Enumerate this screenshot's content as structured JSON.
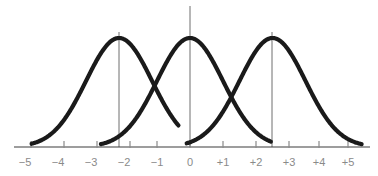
{
  "figure": {
    "name": "three-overlapping-normal-distribution-curves",
    "background_color": "#ffffff",
    "curve_color": "#1a1a1a",
    "curve_stroke_width": 4,
    "axis_color": "#3c3c3c",
    "axis_stroke_width": 1,
    "tick_color": "#8a8a8a",
    "tick_label_color": "#8a8a8a",
    "mean_line_color": "#6e6e6e",
    "mean_line_width": 1
  },
  "chart_data": {
    "type": "line",
    "title": "",
    "subtitle": "",
    "xlabel": "",
    "ylabel": "",
    "xlim": [
      -5.2,
      5.2
    ],
    "ylim": [
      0,
      1.05
    ],
    "grid": false,
    "legend": null,
    "axis": {
      "tick_values": [
        -5,
        -4,
        -3,
        -2,
        -1,
        0,
        1,
        2,
        3,
        4,
        5
      ],
      "tick_labels": [
        "−5",
        "−4",
        "−3",
        "−2",
        "−1",
        "0",
        "+1",
        "+2",
        "+3",
        "+4",
        "+5"
      ],
      "tick_length": 6,
      "axis_y_position": 147,
      "x_zero_pixel": 190,
      "pixels_per_unit": 33
    },
    "series": [
      {
        "name": "curve-left",
        "distribution": "normal",
        "mean": -2.15,
        "sigma": 1.0,
        "peak_value": 1.0,
        "peak_pixel": {
          "x": 119,
          "y": 38
        },
        "x_start": -4.8,
        "x_end": -0.35,
        "mean_line": true
      },
      {
        "name": "curve-center",
        "distribution": "normal",
        "mean": 0.0,
        "sigma": 1.0,
        "peak_value": 1.0,
        "peak_pixel": {
          "x": 190,
          "y": 38
        },
        "x_start": -2.7,
        "x_end": 2.45,
        "mean_line": true
      },
      {
        "name": "curve-right",
        "distribution": "normal",
        "mean": 2.5,
        "sigma": 1.0,
        "peak_value": 1.0,
        "peak_pixel": {
          "x": 272,
          "y": 38
        },
        "x_start": -0.1,
        "x_end": 5.2,
        "mean_line": true
      }
    ],
    "mean_lines": [
      {
        "name": "mean-line-left",
        "x": -2.15,
        "pixel_x": 119,
        "y_top": 32,
        "y_bottom": 147
      },
      {
        "name": "mean-line-center",
        "x": 0.0,
        "pixel_x": 190,
        "y_top": 6,
        "y_bottom": 147
      },
      {
        "name": "mean-line-right",
        "x": 2.5,
        "pixel_x": 272,
        "y_top": 32,
        "y_bottom": 147
      }
    ]
  }
}
